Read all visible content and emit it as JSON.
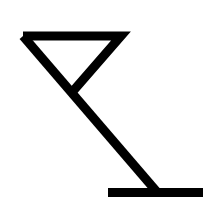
{
  "icon": {
    "name": "cocktail-glass-icon",
    "description": "Tipped martini glass outline",
    "stroke_color": "#000000",
    "background_color": "#ffffff"
  }
}
